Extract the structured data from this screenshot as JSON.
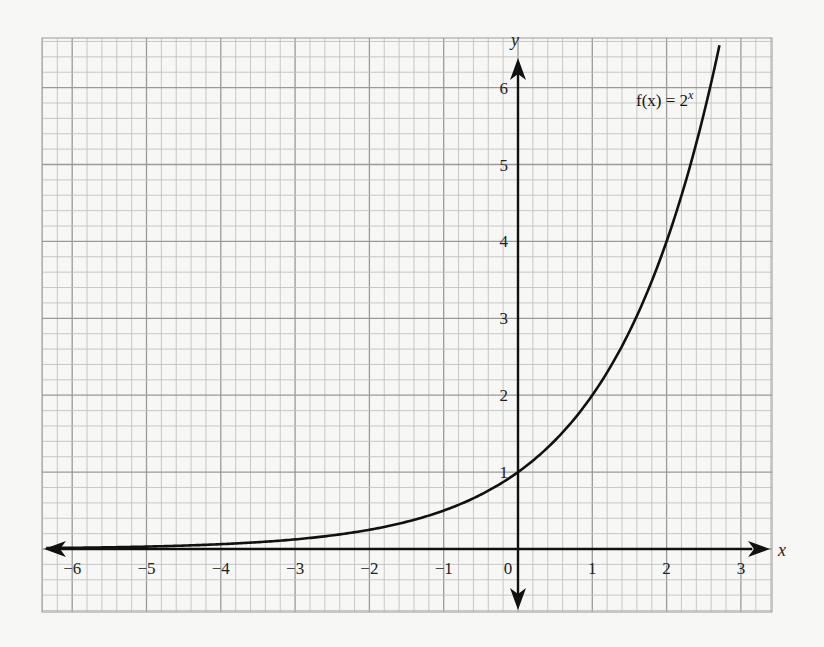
{
  "chart_data": {
    "type": "line",
    "title": "",
    "function_label": "f(x) = 2^x",
    "function_label_parts": {
      "fx": "f(x) = 2",
      "exp": "x"
    },
    "xlabel": "x",
    "ylabel": "y",
    "xlim": [
      -6.4,
      3.4
    ],
    "ylim": [
      -0.8,
      6.6
    ],
    "x_ticks": [
      -6,
      -5,
      -4,
      -3,
      -2,
      -1,
      0,
      1,
      2,
      3
    ],
    "y_ticks": [
      1,
      2,
      3,
      4,
      5,
      6
    ],
    "x_tick_labels": [
      "−6",
      "−5",
      "−4",
      "−3",
      "−2",
      "−1",
      "0",
      "1",
      "2",
      "3"
    ],
    "y_tick_labels": [
      "1",
      "2",
      "3",
      "4",
      "5",
      "6"
    ],
    "grid": true,
    "minor_divisions_per_unit": 5,
    "series": [
      {
        "name": "f(x) = 2^x",
        "x": [
          -6,
          -5,
          -4,
          -3,
          -2,
          -1,
          0,
          1,
          2,
          2.58
        ],
        "values": [
          0.016,
          0.031,
          0.063,
          0.125,
          0.25,
          0.5,
          1,
          2,
          4,
          6
        ]
      }
    ]
  },
  "colors": {
    "background": "#f7f7f5",
    "grid_major": "#9a9a9a",
    "grid_minor": "#c2c2c2",
    "axis": "#111111",
    "curve": "#111111"
  }
}
